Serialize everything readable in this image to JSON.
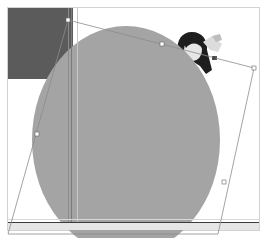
{
  "canvas": {
    "width": 265,
    "height": 238,
    "background": "#ffffff",
    "frame_color": "#cfcfcf"
  },
  "layers": {
    "dark_rectangle": {
      "label": "Dark rectangle layer",
      "color": "#5a5a5a"
    },
    "ellipse": {
      "label": "Gray ellipse layer",
      "color": "#a3a3a3"
    },
    "photo": {
      "label": "Photo layer (woman portrait)"
    },
    "baseline": {
      "label": "Horizontal guide line",
      "color": "#3c3c3c"
    }
  },
  "transform": {
    "label": "Distort transform bounding box",
    "line_color": "#8a8a8a",
    "handles": [
      {
        "name": "top-left",
        "x": 68,
        "y": 20
      },
      {
        "name": "top-mid",
        "x": 162,
        "y": 44
      },
      {
        "name": "top-right",
        "x": 254,
        "y": 68
      },
      {
        "name": "right-mid",
        "x": 224,
        "y": 182
      },
      {
        "name": "left-mid",
        "x": 37,
        "y": 134
      }
    ],
    "pivot": {
      "name": "reference-point",
      "x": 209,
      "y": 58
    }
  }
}
